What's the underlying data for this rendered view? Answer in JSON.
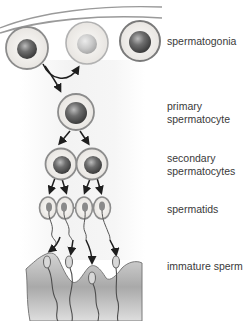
{
  "diagram": {
    "title": "",
    "stages": [
      {
        "id": "spermatogonia",
        "lines": [
          "spermatogonia"
        ]
      },
      {
        "id": "primary",
        "lines": [
          "primary",
          "spermatocyte"
        ]
      },
      {
        "id": "secondary",
        "lines": [
          "secondary",
          "spermatocytes"
        ]
      },
      {
        "id": "spermatids",
        "lines": [
          "spermatids"
        ]
      },
      {
        "id": "immature",
        "lines": [
          "immature sperm"
        ]
      }
    ],
    "colors": {
      "cell_ring": "#8a8a8a",
      "cell_fill": "#f1efec",
      "nucleus_dark": "#5a5a5a",
      "nucleus_pale": "#c4c4c4",
      "arrow": "#1e1e1e",
      "tissue": "#bdbdbd",
      "label_text": "#3a3a3a"
    }
  }
}
